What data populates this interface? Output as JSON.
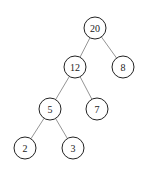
{
  "diagram": {
    "type": "binary-tree",
    "nodes": [
      {
        "id": "n20",
        "label": "20",
        "x": 95,
        "y": 28
      },
      {
        "id": "n12",
        "label": "12",
        "x": 75,
        "y": 67
      },
      {
        "id": "n8",
        "label": "8",
        "x": 123,
        "y": 67
      },
      {
        "id": "n5",
        "label": "5",
        "x": 50,
        "y": 109
      },
      {
        "id": "n7",
        "label": "7",
        "x": 97,
        "y": 109
      },
      {
        "id": "n2",
        "label": "2",
        "x": 25,
        "y": 148
      },
      {
        "id": "n3",
        "label": "3",
        "x": 73,
        "y": 148
      }
    ],
    "edges": [
      [
        "n20",
        "n12"
      ],
      [
        "n20",
        "n8"
      ],
      [
        "n12",
        "n5"
      ],
      [
        "n12",
        "n7"
      ],
      [
        "n5",
        "n2"
      ],
      [
        "n5",
        "n3"
      ]
    ],
    "node_radius": 11
  }
}
